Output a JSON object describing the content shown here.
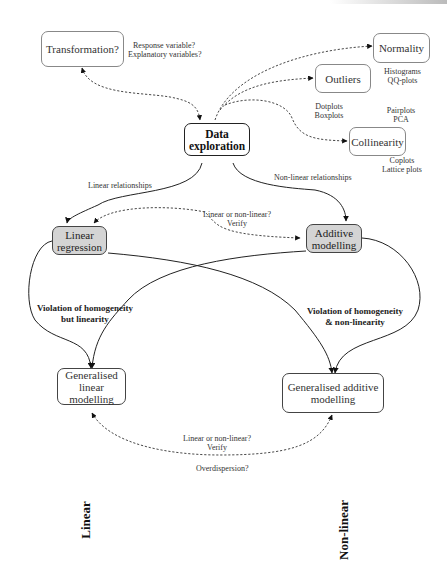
{
  "nodes": {
    "transformation": "Transformation?",
    "normality": "Normality",
    "outliers": "Outliers",
    "data_exploration_line1": "Data",
    "data_exploration_line2": "exploration",
    "collinearity": "Collinearity",
    "linear_regression_line1": "Linear",
    "linear_regression_line2": "regression",
    "additive_modelling_line1": "Additive",
    "additive_modelling_line2": "modelling",
    "glm_line1": "Generalised",
    "glm_line2": "linear modelling",
    "gam_line1": "Generalised additive",
    "gam_line2": "modelling"
  },
  "notes": {
    "transformation_note_1": "Response variable?",
    "transformation_note_2": "Explanatory variables?",
    "normality_note_1": "Histograms",
    "normality_note_2": "QQ-plots",
    "outliers_note_1": "Dotplots",
    "outliers_note_2": "Boxplots",
    "collinearity_pre_1": "Pairplots",
    "collinearity_pre_2": "PCA",
    "collinearity_note_1": "Coplots",
    "collinearity_note_2": "Lattice plots",
    "linear_relationships": "Linear relationships",
    "nonlinear_relationships": "Non-linear relationships",
    "verify_top_1": "Linear or non-linear?",
    "verify_top_2": "Verify",
    "verify_bottom_1": "Linear or non-linear?",
    "verify_bottom_2": "Verify",
    "overdispersion": "Overdispersion?"
  },
  "edge_labels": {
    "violation_linear_1": "Violation of homogeneity",
    "violation_linear_2": "but linearity",
    "violation_nonlinear_1": "Violation of homogeneity",
    "violation_nonlinear_2": "& non-linearity"
  },
  "axis_labels": {
    "linear": "Linear",
    "nonlinear": "Non-linear"
  },
  "colors": {
    "highlight_fill": "#d4d4d4",
    "edge": "#222222",
    "box_border": "#888888"
  }
}
